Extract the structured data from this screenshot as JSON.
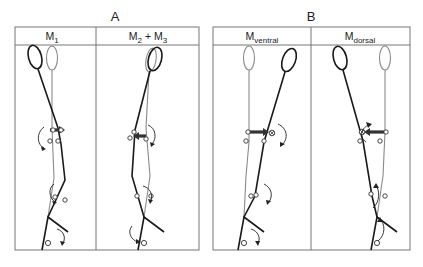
{
  "figure": {
    "groups": [
      {
        "label": "A",
        "panels": [
          {
            "id": "m1",
            "header": {
              "main": "M",
              "sub": "1",
              "rest": ""
            }
          },
          {
            "id": "m2m3",
            "header": {
              "main": "M",
              "sub": "2",
              "rest": " + M",
              "sub2": "3"
            }
          }
        ]
      },
      {
        "label": "B",
        "panels": [
          {
            "id": "mventral",
            "header": {
              "main": "M",
              "sub": "ventral",
              "rest": ""
            }
          },
          {
            "id": "mdorsal",
            "header": {
              "main": "M",
              "sub": "dorsal",
              "rest": ""
            }
          }
        ]
      }
    ],
    "legend_notes": {
      "dark_leg": "active leg (black)",
      "light_leg": "reference leg (grey)",
      "force_arrow": "applied muscle moment at hip",
      "rotation_arrows": "joint rotation direction"
    },
    "colors": {
      "dark": "#1a1a1a",
      "light": "#8a8a8a",
      "frame": "#777777"
    }
  }
}
